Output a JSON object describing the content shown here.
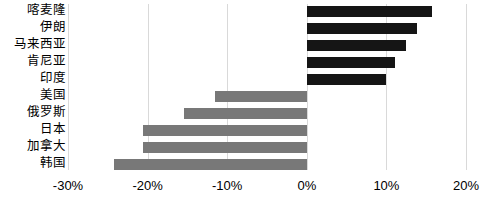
{
  "chart_data": {
    "type": "bar",
    "orientation": "horizontal",
    "title": "",
    "subtitle": "",
    "xlabel": "",
    "ylabel": "",
    "categories": [
      "喀麦隆",
      "伊朗",
      "马来西亚",
      "肯尼亚",
      "印度",
      "美国",
      "俄罗斯",
      "日本",
      "加拿大",
      "韩国"
    ],
    "values": [
      15.7,
      13.8,
      12.5,
      11.1,
      10.0,
      -11.5,
      -15.4,
      -20.6,
      -20.6,
      -24.2
    ],
    "value_labels": [
      "15.7%",
      "13.8%",
      "12.5%",
      "11.1%",
      "10.0%",
      "-11.5%",
      "-15.4%",
      "-20.6%",
      "-20.6%",
      "-24.2%"
    ],
    "bar_colors": [
      "#151515",
      "#151515",
      "#151515",
      "#151515",
      "#151515",
      "#787878",
      "#787878",
      "#787878",
      "#787878",
      "#787878"
    ],
    "xlim": [
      -30,
      20
    ],
    "xticks": [
      -30,
      -20,
      -10,
      0,
      10,
      20
    ],
    "xtick_labels": [
      "-30%",
      "-20%",
      "-10%",
      "0%",
      "10%",
      "20%"
    ],
    "grid": true,
    "grid_axis": "x",
    "legend": false,
    "legend_position": "none",
    "series": [
      {
        "name": "",
        "values": [
          15.7,
          13.8,
          12.5,
          11.1,
          10.0,
          -11.5,
          -15.4,
          -20.6,
          -20.6,
          -24.2
        ]
      }
    ]
  },
  "colors": {
    "positive_bar": "#151515",
    "negative_bar": "#787878",
    "gridline": "#d9d9d9",
    "background": "#ffffff",
    "text": "#000000"
  }
}
